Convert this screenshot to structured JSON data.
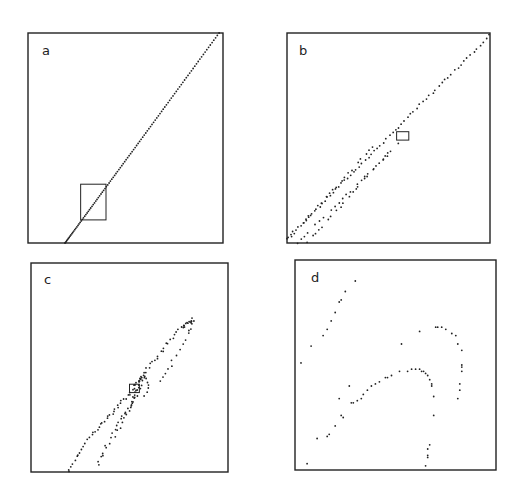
{
  "figure": {
    "panels": [
      {
        "id": "a",
        "label": "a"
      },
      {
        "id": "b",
        "label": "b"
      },
      {
        "id": "c",
        "label": "c"
      },
      {
        "id": "d",
        "label": "d"
      }
    ]
  },
  "chart_data": [
    {
      "type": "scatter",
      "panel": "a",
      "title": "a",
      "description": "Points along a straight diagonal line; inset box marks zoomed region shown in b",
      "xlim": [
        0,
        1
      ],
      "ylim": [
        0,
        1
      ],
      "line_segment": {
        "from": [
          0.19,
          0.0
        ],
        "to": [
          0.98,
          1.0
        ]
      },
      "inset_box": {
        "x": [
          0.27,
          0.4
        ],
        "y": [
          0.11,
          0.28
        ]
      }
    },
    {
      "type": "scatter",
      "panel": "b",
      "title": "b",
      "description": "Points forming several nearly parallel diagonal strands; inset box marks zoomed region shown in c",
      "xlim": [
        0,
        1
      ],
      "ylim": [
        0,
        1
      ],
      "strands": [
        {
          "from": [
            0.0,
            0.02
          ],
          "to": [
            1.0,
            0.99
          ]
        },
        {
          "from": [
            0.05,
            0.0
          ],
          "to": [
            0.55,
            0.47
          ]
        },
        {
          "from": [
            0.1,
            0.0
          ],
          "to": [
            0.5,
            0.43
          ]
        },
        {
          "from": [
            0.02,
            0.03
          ],
          "to": [
            0.42,
            0.46
          ]
        }
      ],
      "inset_box": {
        "x": [
          0.54,
          0.6
        ],
        "y": [
          0.49,
          0.53
        ]
      }
    },
    {
      "type": "scatter",
      "panel": "c",
      "title": "c",
      "description": "Points forming a thin elongated loop structure; inset box marks zoomed region shown in d",
      "xlim": [
        0,
        1
      ],
      "ylim": [
        0,
        1
      ],
      "inset_box": {
        "x": [
          0.5,
          0.55
        ],
        "y": [
          0.38,
          0.42
        ]
      }
    },
    {
      "type": "scatter",
      "panel": "d",
      "title": "d",
      "description": "Sparse points forming curved arcs",
      "xlim": [
        0,
        1
      ],
      "ylim": [
        0,
        1
      ],
      "points": [
        [
          0.3,
          0.9
        ],
        [
          0.25,
          0.85
        ],
        [
          0.23,
          0.81
        ],
        [
          0.22,
          0.8
        ],
        [
          0.2,
          0.75
        ],
        [
          0.18,
          0.71
        ],
        [
          0.16,
          0.67
        ],
        [
          0.14,
          0.64
        ],
        [
          0.08,
          0.59
        ],
        [
          0.03,
          0.51
        ],
        [
          0.62,
          0.66
        ],
        [
          0.7,
          0.68
        ],
        [
          0.71,
          0.68
        ],
        [
          0.73,
          0.68
        ],
        [
          0.75,
          0.67
        ],
        [
          0.78,
          0.65
        ],
        [
          0.8,
          0.64
        ],
        [
          0.81,
          0.6
        ],
        [
          0.83,
          0.57
        ],
        [
          0.83,
          0.5
        ],
        [
          0.83,
          0.49
        ],
        [
          0.83,
          0.47
        ],
        [
          0.82,
          0.41
        ],
        [
          0.82,
          0.38
        ],
        [
          0.81,
          0.34
        ],
        [
          0.53,
          0.6
        ],
        [
          0.56,
          0.47
        ],
        [
          0.58,
          0.48
        ],
        [
          0.6,
          0.48
        ],
        [
          0.62,
          0.48
        ],
        [
          0.63,
          0.47
        ],
        [
          0.64,
          0.47
        ],
        [
          0.65,
          0.46
        ],
        [
          0.66,
          0.45
        ],
        [
          0.67,
          0.43
        ],
        [
          0.68,
          0.41
        ],
        [
          0.68,
          0.4
        ],
        [
          0.69,
          0.35
        ],
        [
          0.69,
          0.26
        ],
        [
          0.52,
          0.47
        ],
        [
          0.48,
          0.45
        ],
        [
          0.46,
          0.44
        ],
        [
          0.45,
          0.44
        ],
        [
          0.42,
          0.42
        ],
        [
          0.4,
          0.41
        ],
        [
          0.38,
          0.4
        ],
        [
          0.36,
          0.38
        ],
        [
          0.34,
          0.36
        ],
        [
          0.33,
          0.34
        ],
        [
          0.31,
          0.33
        ],
        [
          0.29,
          0.32
        ],
        [
          0.28,
          0.32
        ],
        [
          0.27,
          0.4
        ],
        [
          0.22,
          0.34
        ],
        [
          0.24,
          0.25
        ],
        [
          0.23,
          0.26
        ],
        [
          0.2,
          0.21
        ],
        [
          0.17,
          0.17
        ],
        [
          0.16,
          0.16
        ],
        [
          0.11,
          0.15
        ],
        [
          0.06,
          0.03
        ],
        [
          0.67,
          0.12
        ],
        [
          0.66,
          0.1
        ],
        [
          0.66,
          0.07
        ],
        [
          0.66,
          0.06
        ],
        [
          0.65,
          0.02
        ]
      ]
    }
  ]
}
